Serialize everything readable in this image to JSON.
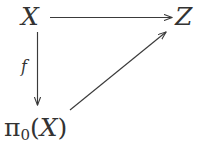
{
  "figure": {
    "kind": "commutative-diagram",
    "background_color": "#ffffff",
    "ink_color": "#3a3a3a",
    "width": 202,
    "height": 154
  },
  "nodes": {
    "top_left": "X",
    "top_right": "Z",
    "bottom_left_pi": "π",
    "bottom_left_subscript": "0",
    "bottom_left_open_paren": "(",
    "bottom_left_var": "X",
    "bottom_left_close_paren": ")",
    "bottom_left_full": "π₀(X)"
  },
  "edges": [
    {
      "id": "x-to-z",
      "from": "X",
      "to": "Z",
      "label": "",
      "style": "solid",
      "head": "arrow",
      "orientation": "horizontal"
    },
    {
      "id": "x-to-pi0x",
      "from": "X",
      "to": "π₀(X)",
      "label": "f",
      "style": "solid",
      "head": "arrow",
      "orientation": "vertical"
    },
    {
      "id": "pi0x-to-z",
      "from": "π₀(X)",
      "to": "Z",
      "label": "",
      "style": "solid",
      "head": "arrow",
      "orientation": "diagonal"
    }
  ],
  "labels": {
    "f": "f"
  }
}
